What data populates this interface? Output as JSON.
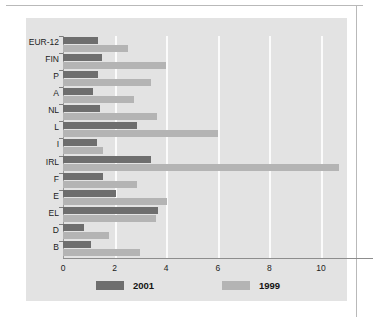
{
  "chart_data": {
    "type": "bar",
    "orientation": "horizontal",
    "title": "",
    "xlabel": "",
    "ylabel": "",
    "xlim": [
      0,
      11
    ],
    "grid": true,
    "grid_axis": "x",
    "xticks": [
      "0",
      "2",
      "4",
      "6",
      "8",
      "10"
    ],
    "xtick_values": [
      0,
      2,
      4,
      6,
      8,
      10
    ],
    "categories": [
      "EUR-12",
      "FIN",
      "P",
      "A",
      "NL",
      "L",
      "I",
      "IRL",
      "F",
      "E",
      "EL",
      "D",
      "B"
    ],
    "legend_position": "bottom",
    "series": [
      {
        "name": "2001",
        "color": "#6e6e6e",
        "values": [
          1.35,
          1.5,
          1.35,
          1.15,
          1.45,
          2.85,
          1.3,
          3.4,
          1.55,
          2.05,
          3.7,
          0.8,
          1.1
        ]
      },
      {
        "name": "1999",
        "color": "#b4b4b4",
        "values": [
          2.5,
          4.0,
          3.4,
          2.75,
          3.65,
          6.0,
          1.55,
          10.7,
          2.85,
          4.05,
          3.6,
          1.8,
          3.0
        ]
      }
    ]
  },
  "legend": {
    "entries": [
      {
        "label": "2001",
        "color": "#6e6e6e"
      },
      {
        "label": "1999",
        "color": "#b4b4b4"
      }
    ]
  },
  "colors": {
    "panel_background": "#e3e3e3",
    "page_background": "#ffffff",
    "gridline": "#fbfbfb",
    "axis": "#8d8d8d",
    "series_2001": "#6e6e6e",
    "series_1999": "#b4b4b4"
  }
}
